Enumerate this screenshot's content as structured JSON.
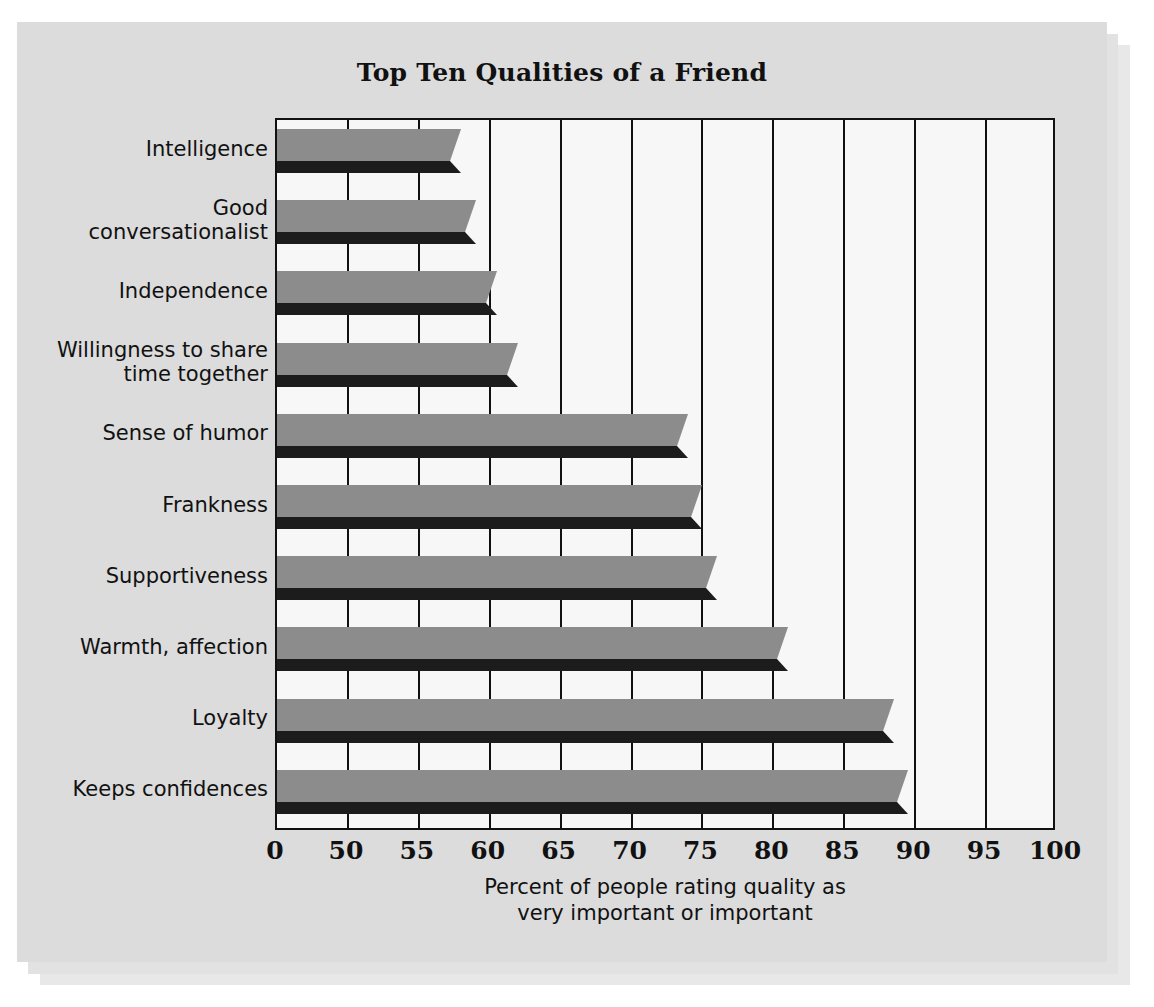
{
  "chart_data": {
    "type": "bar",
    "orientation": "horizontal",
    "title": "Top Ten Qualities of a Friend",
    "xlabel_line1": "Percent of people rating quality as",
    "xlabel_line2": "very important or important",
    "ylabel": "",
    "grid": true,
    "legend": "none",
    "axis_note": "broken x-axis: 0 then 50 to 100 in steps of 5",
    "xlim": [
      0,
      100
    ],
    "xticks": [
      0,
      50,
      55,
      60,
      65,
      70,
      75,
      80,
      85,
      90,
      95,
      100
    ],
    "xtick_labels": [
      "0",
      "50",
      "55",
      "60",
      "65",
      "70",
      "75",
      "80",
      "85",
      "90",
      "95",
      "100"
    ],
    "categories": [
      "Intelligence",
      "Good conversationalist",
      "Independence",
      "Willingness to share time together",
      "Sense of humor",
      "Frankness",
      "Supportiveness",
      "Warmth, affection",
      "Loyalty",
      "Keeps confidences"
    ],
    "values": [
      58,
      59,
      60.5,
      62,
      74,
      75,
      76,
      81,
      88.5,
      89.5
    ],
    "units": "percent"
  },
  "labels": {
    "lines": [
      [
        "Intelligence"
      ],
      [
        "Good",
        "conversationalist"
      ],
      [
        "Independence"
      ],
      [
        "Willingness to share",
        "time together"
      ],
      [
        "Sense of humor"
      ],
      [
        "Frankness"
      ],
      [
        "Supportiveness"
      ],
      [
        "Warmth, affection"
      ],
      [
        "Loyalty"
      ],
      [
        "Keeps confidences"
      ]
    ]
  },
  "colors": {
    "page_background": "#ffffff",
    "card_background": "#dcdcdc",
    "plot_background": "#f7f7f7",
    "bar_face": "#8c8c8c",
    "bar_shadow": "#1c1c1c",
    "axis": "#111111",
    "text": "#111111"
  }
}
